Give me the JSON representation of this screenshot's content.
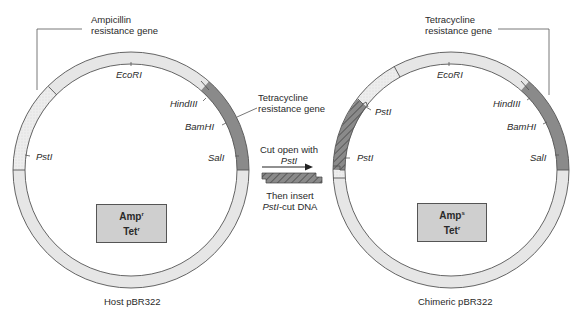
{
  "host_plasmid": {
    "title": "Host pBR322",
    "callout_amp": [
      "Ampicillin",
      "resistance gene"
    ],
    "callout_tet": [
      "Tetracycline",
      "resistance gene"
    ],
    "sites": {
      "ecori": "EcoRI",
      "hindiii": "HindIII",
      "bamhi": "BamHI",
      "sali": "SalI",
      "psti": "PstI"
    },
    "phenotype": {
      "amp_base": "Amp",
      "amp_sup": "r",
      "tet_base": "Tet",
      "tet_sup": "r"
    }
  },
  "procedure": {
    "step1_line1": "Cut open with",
    "step1_line2": "PstI",
    "step2_line1": "Then insert",
    "step2_line2_italic": "PstI",
    "step2_line2_rest": "-cut DNA"
  },
  "chimeric_plasmid": {
    "title": "Chimeric pBR322",
    "callout_tet": [
      "Tetracycline",
      "resistance gene"
    ],
    "sites": {
      "ecori": "EcoRI",
      "hindiii": "HindIII",
      "bamhi": "BamHI",
      "sali": "SalI",
      "psti_upper": "PstI",
      "psti_lower": "PstI"
    },
    "phenotype": {
      "amp_base": "Amp",
      "amp_sup": "s",
      "tet_base": "Tet",
      "tet_sup": "r"
    }
  },
  "colors": {
    "ring_light": "#e6e6e6",
    "amp_gene": "#ececec",
    "tet_gene": "#8a8a8a",
    "insert_dna": "#7d7d7d",
    "box_fill": "#cfcfcf",
    "outline": "#555555"
  }
}
